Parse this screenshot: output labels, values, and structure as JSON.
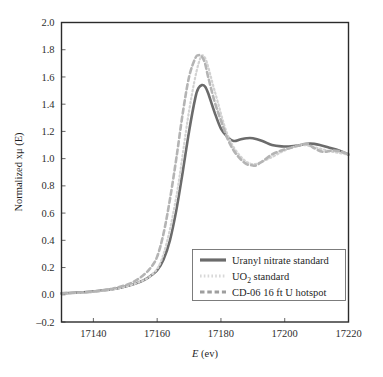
{
  "chart_data": {
    "type": "line",
    "title": "",
    "xlabel": "E (ev)",
    "ylabel": "Normalized xμ (E)",
    "xlim": [
      17130,
      17220
    ],
    "ylim": [
      -0.2,
      2.0
    ],
    "grid": false,
    "legend_position": "lower-right",
    "xticks": [
      "17140",
      "17160",
      "17180",
      "17200",
      "17220"
    ],
    "xtick_values": [
      17140,
      17160,
      17180,
      17200,
      17220
    ],
    "yticks": [
      "-0.2",
      "0.0",
      "0.2",
      "0.4",
      "0.6",
      "0.8",
      "1.0",
      "1.2",
      "1.4",
      "1.6",
      "1.8",
      "2.0"
    ],
    "ytick_values": [
      -0.2,
      0.0,
      0.2,
      0.4,
      0.6,
      0.8,
      1.0,
      1.2,
      1.4,
      1.6,
      1.8,
      2.0
    ],
    "series": [
      {
        "name": "Uranyl nitrate standard",
        "style": "solid",
        "color": "#6b6b6b",
        "width": 2.6,
        "x": [
          17130,
          17134,
          17138,
          17142,
          17146,
          17150,
          17153,
          17156,
          17158,
          17160,
          17162,
          17164,
          17166,
          17168,
          17170,
          17172,
          17173,
          17174,
          17175,
          17176,
          17178,
          17180,
          17182,
          17184,
          17186,
          17188,
          17190,
          17193,
          17196,
          17199,
          17202,
          17205,
          17208,
          17211,
          17214,
          17217,
          17220
        ],
        "y": [
          0.01,
          0.015,
          0.02,
          0.03,
          0.04,
          0.06,
          0.08,
          0.11,
          0.14,
          0.18,
          0.26,
          0.4,
          0.62,
          0.9,
          1.2,
          1.45,
          1.52,
          1.54,
          1.53,
          1.48,
          1.34,
          1.22,
          1.16,
          1.13,
          1.14,
          1.15,
          1.15,
          1.13,
          1.1,
          1.09,
          1.09,
          1.1,
          1.11,
          1.1,
          1.08,
          1.06,
          1.03
        ]
      },
      {
        "name": "UO2 standard",
        "style": "dotted",
        "color": "#d2d2d2",
        "width": 2.2,
        "x": [
          17130,
          17140,
          17150,
          17158,
          17162,
          17166,
          17170,
          17173,
          17175,
          17178,
          17182,
          17186,
          17190,
          17195,
          17200,
          17205,
          17210,
          17215,
          17220
        ],
        "y": [
          0.01,
          0.02,
          0.06,
          0.14,
          0.3,
          0.72,
          1.35,
          1.7,
          1.74,
          1.5,
          1.18,
          1.02,
          0.96,
          1.0,
          1.06,
          1.1,
          1.08,
          1.05,
          1.03
        ]
      },
      {
        "name": "CD-06 16 ft U hotspot",
        "style": "dashed",
        "color": "#b4b4b4",
        "width": 2.6,
        "x": [
          17130,
          17134,
          17138,
          17142,
          17146,
          17150,
          17153,
          17156,
          17158,
          17160,
          17162,
          17164,
          17166,
          17168,
          17170,
          17172,
          17173,
          17174,
          17175,
          17176,
          17178,
          17180,
          17182,
          17184,
          17186,
          17188,
          17190,
          17191,
          17193,
          17196,
          17199,
          17202,
          17205,
          17207,
          17209,
          17212,
          17215,
          17218,
          17220
        ],
        "y": [
          0.01,
          0.015,
          0.02,
          0.03,
          0.045,
          0.07,
          0.1,
          0.15,
          0.2,
          0.28,
          0.45,
          0.7,
          1.0,
          1.33,
          1.6,
          1.74,
          1.76,
          1.75,
          1.7,
          1.6,
          1.42,
          1.28,
          1.15,
          1.06,
          1.0,
          0.96,
          0.95,
          0.95,
          0.98,
          1.03,
          1.06,
          1.08,
          1.1,
          1.11,
          1.08,
          1.05,
          1.06,
          1.05,
          1.03
        ]
      }
    ]
  },
  "legend": {
    "entries": [
      {
        "label": "Uranyl nitrate standard",
        "swatch": "solid-line-swatch"
      },
      {
        "label_prefix": "UO",
        "label_sub": "2",
        "label_suffix": " standard",
        "swatch": "dotted-line-swatch"
      },
      {
        "label": "CD-06 16 ft U hotspot",
        "swatch": "dashed-line-swatch"
      }
    ]
  },
  "axis": {
    "x_title_italic": "E",
    "x_title_rest": " (ev)",
    "y_title": "Normalized xμ (E)"
  },
  "colors": {
    "uranyl_nitrate": "#6b6b6b",
    "uo2_standard": "#d2d2d2",
    "cd06_hotspot": "#b4b4b4",
    "frame": "#2b2b2b",
    "background": "#ffffff"
  }
}
